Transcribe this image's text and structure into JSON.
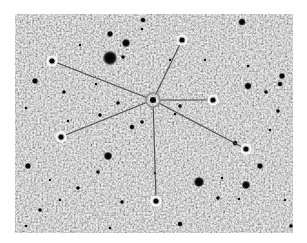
{
  "image": {
    "width": 307,
    "height": 243,
    "description": "Grayscale star field with a central star connected by lines to six circled stars",
    "field": {
      "x": 15,
      "y": 14,
      "width": 278,
      "height": 219
    },
    "colors": {
      "page_background": "#ffffff",
      "field_background": "#a9a9a9",
      "noise_light": "#d6d6d6",
      "noise_dark": "#7a7a7a",
      "star": "#0a0a0a",
      "connector_line": "#4a4a4a",
      "marker_ring": "#ffffff"
    }
  },
  "center_star": {
    "x": 153,
    "y": 100,
    "r": 3
  },
  "marked_stars": [
    {
      "id": "top",
      "x": 182,
      "y": 40
    },
    {
      "id": "upper-left",
      "x": 52,
      "y": 61
    },
    {
      "id": "right",
      "x": 213,
      "y": 100
    },
    {
      "id": "lower-right",
      "x": 246,
      "y": 149
    },
    {
      "id": "lower-left",
      "x": 61,
      "y": 137
    },
    {
      "id": "bottom",
      "x": 156,
      "y": 201
    }
  ],
  "field_stars": [
    {
      "x": 110,
      "y": 58,
      "r": 7
    },
    {
      "x": 126,
      "y": 43,
      "r": 4
    },
    {
      "x": 110,
      "y": 34,
      "r": 3
    },
    {
      "x": 123,
      "y": 57,
      "r": 2
    },
    {
      "x": 143,
      "y": 20,
      "r": 2.5
    },
    {
      "x": 142,
      "y": 29,
      "r": 1.5
    },
    {
      "x": 242,
      "y": 22,
      "r": 3.5
    },
    {
      "x": 248,
      "y": 86,
      "r": 3.5
    },
    {
      "x": 282,
      "y": 76,
      "r": 3
    },
    {
      "x": 280,
      "y": 84,
      "r": 2.5
    },
    {
      "x": 266,
      "y": 92,
      "r": 2
    },
    {
      "x": 278,
      "y": 111,
      "r": 2
    },
    {
      "x": 248,
      "y": 66,
      "r": 1.5
    },
    {
      "x": 35,
      "y": 81,
      "r": 3
    },
    {
      "x": 64,
      "y": 92,
      "r": 2
    },
    {
      "x": 96,
      "y": 84,
      "r": 1.5
    },
    {
      "x": 118,
      "y": 103,
      "r": 2
    },
    {
      "x": 100,
      "y": 115,
      "r": 2
    },
    {
      "x": 26,
      "y": 108,
      "r": 1.5
    },
    {
      "x": 68,
      "y": 121,
      "r": 1.5
    },
    {
      "x": 132,
      "y": 127,
      "r": 2.5
    },
    {
      "x": 142,
      "y": 122,
      "r": 2
    },
    {
      "x": 180,
      "y": 106,
      "r": 2
    },
    {
      "x": 175,
      "y": 114,
      "r": 1.5
    },
    {
      "x": 235,
      "y": 143,
      "r": 2.5
    },
    {
      "x": 108,
      "y": 156,
      "r": 4
    },
    {
      "x": 28,
      "y": 166,
      "r": 3
    },
    {
      "x": 98,
      "y": 172,
      "r": 2
    },
    {
      "x": 78,
      "y": 188,
      "r": 2
    },
    {
      "x": 40,
      "y": 210,
      "r": 2
    },
    {
      "x": 26,
      "y": 226,
      "r": 1.5
    },
    {
      "x": 199,
      "y": 182,
      "r": 5
    },
    {
      "x": 246,
      "y": 185,
      "r": 4
    },
    {
      "x": 260,
      "y": 166,
      "r": 3
    },
    {
      "x": 218,
      "y": 198,
      "r": 2
    },
    {
      "x": 239,
      "y": 199,
      "r": 1.5
    },
    {
      "x": 291,
      "y": 226,
      "r": 2
    },
    {
      "x": 122,
      "y": 202,
      "r": 2
    },
    {
      "x": 180,
      "y": 224,
      "r": 2.5
    },
    {
      "x": 110,
      "y": 228,
      "r": 1.5
    },
    {
      "x": 155,
      "y": 173,
      "r": 1.5
    },
    {
      "x": 222,
      "y": 178,
      "r": 1.5
    },
    {
      "x": 60,
      "y": 200,
      "r": 1.2
    },
    {
      "x": 270,
      "y": 130,
      "r": 1.5
    },
    {
      "x": 205,
      "y": 60,
      "r": 1.2
    },
    {
      "x": 170,
      "y": 60,
      "r": 1.2
    },
    {
      "x": 80,
      "y": 45,
      "r": 1.2
    },
    {
      "x": 50,
      "y": 180,
      "r": 1.2
    },
    {
      "x": 285,
      "y": 200,
      "r": 1.2
    }
  ]
}
